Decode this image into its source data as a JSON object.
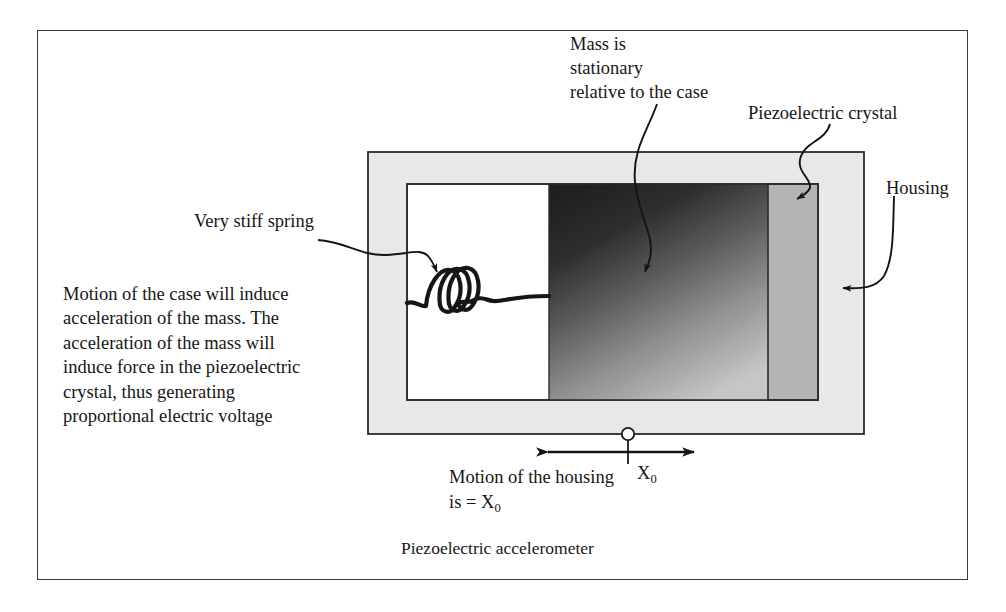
{
  "figure": {
    "caption": "Piezoelectric accelerometer",
    "frame_color": "#3a3a3a",
    "background": "#ffffff"
  },
  "labels": {
    "mass_note": "Mass is\nstationary\nrelative to the case",
    "crystal": "Piezoelectric crystal",
    "housing": "Housing",
    "spring": "Very stiff spring",
    "description": "Motion of the case will induce\nacceleration of the mass. The\nacceleration of the mass will\ninduce force in the piezoelectric\ncrystal, thus generating\nproportional electric voltage",
    "motion_line1": "Motion of the housing",
    "motion_line2_pre": "is = X",
    "motion_line2_sub": "0",
    "x0_symbol": "X",
    "x0_sub": "0"
  },
  "components": {
    "housing": {
      "name": "housing-body",
      "fill": "#e8e8e8",
      "stroke": "#2b2b2b",
      "x": 368,
      "y": 152,
      "w": 496,
      "h": 282
    },
    "cavity": {
      "name": "inner-cavity",
      "fill": "#ffffff",
      "stroke": "#2b2b2b",
      "x": 407,
      "y": 184,
      "w": 411,
      "h": 216
    },
    "spring_chamber": {
      "name": "spring-chamber",
      "fill": "#ffffff",
      "x": 407,
      "y": 184,
      "w": 142,
      "h": 216
    },
    "mass": {
      "name": "seismic-mass",
      "gradient_from": "#232323",
      "gradient_to": "#c2c2c2",
      "x": 549,
      "y": 184,
      "w": 219,
      "h": 216
    },
    "crystal": {
      "name": "piezoelectric-crystal",
      "fill": "#b4b4b4",
      "stroke": "#2b2b2b",
      "x": 768,
      "y": 184,
      "w": 50,
      "h": 216
    },
    "spring": {
      "name": "coil-spring",
      "coils": 3,
      "stroke": "#151515"
    },
    "motion_marker": {
      "name": "motion-pivot",
      "cx": 628,
      "cy": 434,
      "r": 6,
      "arrow_left_x": 540,
      "arrow_right_x": 700,
      "arrow_y": 452
    }
  },
  "leaders": [
    {
      "name": "leader-mass",
      "target_x": 645,
      "target_y": 272
    },
    {
      "name": "leader-crystal",
      "target_x": 797,
      "target_y": 199
    },
    {
      "name": "leader-housing",
      "target_x": 843,
      "target_y": 288
    },
    {
      "name": "leader-spring",
      "target_x": 437,
      "target_y": 272
    }
  ]
}
